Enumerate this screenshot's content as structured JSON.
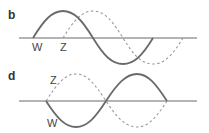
{
  "panels": [
    {
      "id": "b",
      "label": "b",
      "axis": {
        "y": 38,
        "x1": 19,
        "x2": 197
      },
      "waves": [
        {
          "name": "W",
          "style": "solid",
          "label": "W",
          "start_x": 33,
          "wavelength": 120,
          "amplitude": 27,
          "phase": "up-first"
        },
        {
          "name": "Z",
          "style": "dashed",
          "label": "Z",
          "start_x": 63,
          "wavelength": 120,
          "amplitude": 27,
          "phase": "up-first"
        }
      ],
      "labels": [
        {
          "text": "W",
          "x": 32,
          "y": 51
        },
        {
          "text": "Z",
          "x": 60,
          "y": 51
        }
      ],
      "relationship": "Z lags W by a quarter wavelength (90° out of phase)"
    },
    {
      "id": "d",
      "label": "d",
      "axis": {
        "y": 101,
        "x1": 19,
        "x2": 197
      },
      "waves": [
        {
          "name": "W",
          "style": "solid",
          "label": "W",
          "start_x": 46,
          "wavelength": 121,
          "amplitude": 26,
          "phase": "down-first"
        },
        {
          "name": "Z",
          "style": "dashed",
          "label": "Z",
          "start_x": 46,
          "wavelength": 121,
          "amplitude": 26,
          "phase": "up-first"
        }
      ],
      "labels": [
        {
          "text": "Z",
          "x": 50,
          "y": 84
        },
        {
          "text": "W",
          "x": 47,
          "y": 127
        }
      ],
      "relationship": "Z and W are 180° out of phase (destructive interference)"
    }
  ],
  "colors": {
    "solid_wave": "#6a6a6a",
    "dashed_wave": "#9a9a9a",
    "axis": "#6b6b6b",
    "text": "#333333"
  }
}
